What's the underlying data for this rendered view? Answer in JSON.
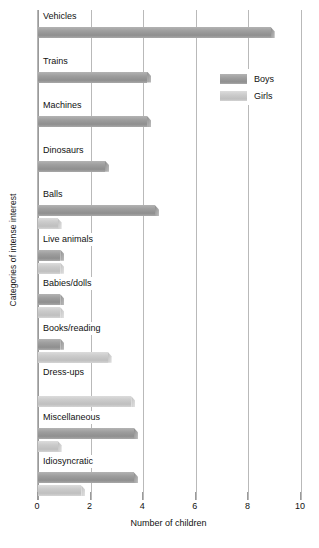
{
  "chart_data": {
    "type": "bar",
    "orientation": "horizontal",
    "title": "",
    "xlabel": "Number of children",
    "ylabel": "Categories of intense interest",
    "xlim": [
      0,
      10
    ],
    "xticks": [
      0,
      2,
      4,
      6,
      8,
      10
    ],
    "xtick_labels": [
      "0",
      "2",
      "4",
      "6",
      "8",
      "10"
    ],
    "grid": true,
    "legend_position": "upper right",
    "categories": [
      "Vehicles",
      "Trains",
      "Machines",
      "Dinosaurs",
      "Balls",
      "Live animals",
      "Babies/dolls",
      "Books/reading",
      "Dress-ups",
      "Miscellaneous",
      "Idiosyncratic"
    ],
    "series": [
      {
        "name": "Boys",
        "color": "#9e9e9e",
        "values": [
          9,
          4.3,
          4.3,
          2.7,
          4.6,
          1,
          1,
          1,
          0,
          3.8,
          3.8
        ]
      },
      {
        "name": "Girls",
        "color": "#cbcbcb",
        "values": [
          0,
          0,
          0,
          0,
          0.9,
          1,
          1,
          2.8,
          3.7,
          0.9,
          1.8
        ]
      }
    ]
  },
  "axes": {
    "x_title": "Number of children",
    "y_title": "Categories of intense interest"
  },
  "legend": {
    "items": [
      {
        "label": "Boys",
        "swatch": "boys"
      },
      {
        "label": "Girls",
        "swatch": "girls"
      }
    ]
  },
  "colors": {
    "boys": "#9e9e9e",
    "girls": "#cbcbcb",
    "gridline": "#b9b9b9",
    "text": "#111111",
    "background": "#ffffff"
  }
}
